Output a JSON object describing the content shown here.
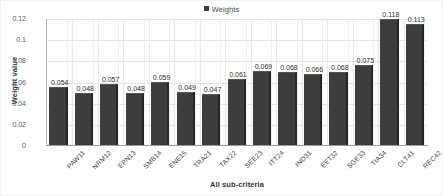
{
  "chart_data": {
    "type": "bar",
    "title": "",
    "xlabel": "All sub-criteria",
    "ylabel": "Weight value",
    "legend": {
      "position": "top-center",
      "entries": [
        "Weights"
      ]
    },
    "series_name": "Weights",
    "categories": [
      "PAW11",
      "NRM12",
      "EPN13",
      "SMB14",
      "ENE15",
      "TRA21",
      "TAX22",
      "SEE23",
      "ITT24",
      "IND31",
      "EET32",
      "SGE33",
      "TIA34",
      "CLT41",
      "REC42"
    ],
    "values": [
      0.054,
      0.048,
      0.057,
      0.048,
      0.059,
      0.049,
      0.047,
      0.061,
      0.069,
      0.068,
      0.066,
      0.068,
      0.075,
      0.118,
      0.113
    ],
    "data_labels": [
      "0.054",
      "0.048",
      "0.057",
      "0.048",
      "0.059",
      "0.049",
      "0.047",
      "0.061",
      "0.069",
      "0.068",
      "0.066",
      "0.068",
      "0.075",
      "0.118",
      "0.113"
    ],
    "ylim": [
      0,
      0.12
    ],
    "yticks": [
      0,
      0.02,
      0.04,
      0.06,
      0.08,
      0.1,
      0.12
    ],
    "ytick_labels": [
      "0",
      "0.02",
      "0.04",
      "0.06",
      "0.08",
      "0.1",
      "0.12"
    ],
    "grid": {
      "horizontal": true,
      "vertical": true
    },
    "colors": {
      "bar": "#3d3d3d",
      "bar_shade": "#262626",
      "gridline": "#e3e3e3",
      "axis": "#9a9a9a",
      "text": "#3a3a3a",
      "background": "#ffffff"
    }
  }
}
